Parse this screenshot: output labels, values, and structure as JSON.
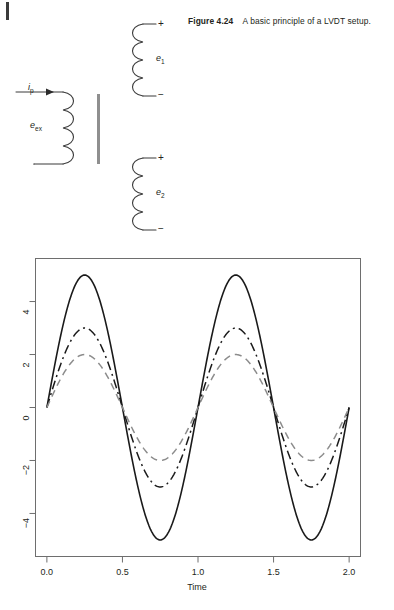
{
  "figure": {
    "caption_label": "Figure 4.24",
    "caption_text": "A basic principle of a LVDT setup.",
    "primary_coil": {
      "voltage_label": "e",
      "voltage_sub": "ex",
      "current_label": "i",
      "current_sub": "p"
    },
    "secondary_coil_top": {
      "voltage_label": "e",
      "voltage_sub": "1",
      "plus": "+",
      "minus": "−"
    },
    "secondary_coil_bottom": {
      "voltage_label": "e",
      "voltage_sub": "2",
      "plus": "+",
      "minus": "−"
    },
    "armature_name": "core-bar"
  },
  "chart_data": {
    "type": "line",
    "title": "",
    "xlabel": "Time",
    "ylabel": "",
    "xlim": [
      0,
      2
    ],
    "ylim": [
      -5.4,
      5.4
    ],
    "xticks": [
      "0.0",
      "0.5",
      "1.0",
      "1.5",
      "2.0"
    ],
    "xtick_values": [
      0.0,
      0.5,
      1.0,
      1.5,
      2.0
    ],
    "yticks": [
      "4",
      "2",
      "0",
      "−2",
      "−4"
    ],
    "ytick_values": [
      4,
      2,
      0,
      -2,
      -4
    ],
    "grid": false,
    "legend": "none",
    "box": true,
    "series": [
      {
        "name": "excitation",
        "amplitude": 5,
        "frequency": 1,
        "phase": 0,
        "style": "solid",
        "color": "#1a1a1a",
        "width": 1.6
      },
      {
        "name": "secondary-1",
        "amplitude": 3,
        "frequency": 1,
        "phase": 0,
        "style": "dashdot",
        "color": "#1a1a1a",
        "width": 1.5
      },
      {
        "name": "secondary-2",
        "amplitude": 2,
        "frequency": 1,
        "phase": 0,
        "style": "dashed",
        "color": "#8c8c8c",
        "width": 1.5
      }
    ],
    "x": [
      0,
      0.05,
      0.1,
      0.15,
      0.2,
      0.25,
      0.3,
      0.35,
      0.4,
      0.45,
      0.5,
      0.55,
      0.6,
      0.65,
      0.7,
      0.75,
      0.8,
      0.85,
      0.9,
      0.95,
      1.0,
      1.05,
      1.1,
      1.15,
      1.2,
      1.25,
      1.3,
      1.35,
      1.4,
      1.45,
      1.5,
      1.55,
      1.6,
      1.65,
      1.7,
      1.75,
      1.8,
      1.85,
      1.9,
      1.95,
      2.0
    ],
    "values_solid": [
      0,
      1.545,
      2.939,
      4.045,
      4.755,
      5,
      4.755,
      4.045,
      2.939,
      1.545,
      0,
      -1.545,
      -2.939,
      -4.045,
      -4.755,
      -5,
      -4.755,
      -4.045,
      -2.939,
      -1.545,
      0,
      1.545,
      2.939,
      4.045,
      4.755,
      5,
      4.755,
      4.045,
      2.939,
      1.545,
      0,
      -1.545,
      -2.939,
      -4.045,
      -4.755,
      -5,
      -4.755,
      -4.045,
      -2.939,
      -1.545,
      0
    ],
    "values_dashdot": [
      0,
      0.927,
      1.763,
      2.427,
      2.853,
      3,
      2.853,
      2.427,
      1.763,
      0.927,
      0,
      -0.927,
      -1.763,
      -2.427,
      -2.853,
      -3,
      -2.853,
      -2.427,
      -1.763,
      -0.927,
      0,
      0.927,
      1.763,
      2.427,
      2.853,
      3,
      2.853,
      2.427,
      1.763,
      0.927,
      0,
      -0.927,
      -1.763,
      -2.427,
      -2.853,
      -3,
      -2.853,
      -2.427,
      -1.763,
      -0.927,
      0
    ],
    "values_dashed": [
      0,
      0.618,
      1.176,
      1.618,
      1.902,
      2,
      1.902,
      1.618,
      1.176,
      0.618,
      0,
      -0.618,
      -1.176,
      -1.618,
      -1.902,
      -2,
      -1.902,
      -1.618,
      -1.176,
      -0.618,
      0,
      0.618,
      1.176,
      1.618,
      1.902,
      2,
      1.902,
      1.618,
      1.176,
      0.618,
      0,
      -0.618,
      -1.176,
      -1.618,
      -1.902,
      -2,
      -1.902,
      -1.618,
      -1.176,
      -0.618,
      0
    ]
  }
}
